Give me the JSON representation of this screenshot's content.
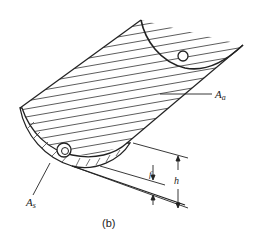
{
  "diagram": {
    "caption": "(b)",
    "labels": {
      "aperture_area": "A",
      "aperture_sub": "a",
      "absorber_area": "A",
      "absorber_sub": "s",
      "focal_length": "f",
      "depth": "h"
    },
    "colors": {
      "line": "#222222",
      "background": "#ffffff"
    }
  }
}
